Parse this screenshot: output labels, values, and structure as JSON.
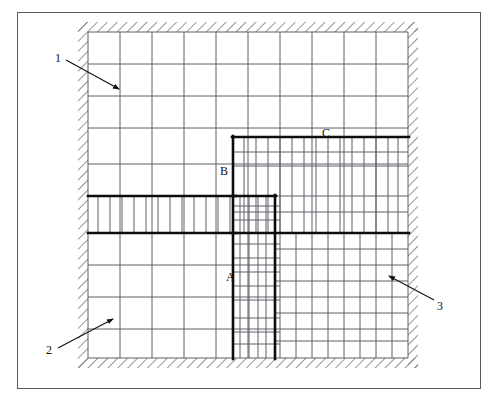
{
  "figure": {
    "kind": "finite-element-mesh-diagram",
    "caption": "",
    "frame_color": "#555b60",
    "mesh_line_color": "#5d6166",
    "bold_line_color": "#0d0d0d",
    "hatch_color": "#6f7479",
    "background": "#ffffff"
  },
  "node_labels": [
    {
      "id": "A",
      "text": "A",
      "x": 226,
      "y": 271
    },
    {
      "id": "B",
      "text": "B",
      "x": 220,
      "y": 165
    },
    {
      "id": "C",
      "text": "C",
      "x": 322,
      "y": 127
    }
  ],
  "callouts": [
    {
      "id": "1",
      "text": "1",
      "label_x": 55,
      "label_y": 52,
      "line": {
        "x1": 66,
        "y1": 60,
        "x2": 121,
        "y2": 90
      },
      "target": "interior-coarse-mesh-cell"
    },
    {
      "id": "2",
      "text": "2",
      "label_x": 46,
      "label_y": 344,
      "line": {
        "x1": 58,
        "y1": 348,
        "x2": 114,
        "y2": 318
      },
      "target": "lower-left-boundary-cell"
    },
    {
      "id": "3",
      "text": "3",
      "label_x": 437,
      "label_y": 306,
      "line": {
        "x1": 434,
        "y1": 300,
        "x2": 387,
        "y2": 275
      },
      "target": "right-boundary-cell"
    }
  ],
  "domain": {
    "mesh_left": 88,
    "mesh_right": 408,
    "mesh_top": 32,
    "mesh_bottom": 358,
    "wall_thickness": 10
  },
  "grid": {
    "coarse_x": [
      88,
      120,
      152,
      184,
      216,
      248,
      280,
      312,
      344,
      376,
      408
    ],
    "coarse_y": [
      32,
      64,
      96,
      128,
      164,
      196,
      233,
      265,
      297,
      329,
      358
    ]
  },
  "refined_regions": [
    {
      "name": "horizontal-band-left",
      "x0": 88,
      "y0": 196,
      "x1": 248,
      "y1": 233,
      "sub_x": [
        98,
        110,
        122,
        134,
        146,
        158,
        170,
        182,
        194,
        206,
        218,
        230
      ],
      "sub_y": []
    },
    {
      "name": "vertical-column-A",
      "x0": 233,
      "y0": 196,
      "x1": 275,
      "y1": 358,
      "sub_x": [
        240,
        249,
        258,
        266
      ],
      "sub_y": [
        206,
        220,
        244,
        258,
        272,
        286,
        300,
        318,
        332,
        344
      ]
    },
    {
      "name": "block-C-upper-right",
      "x0": 233,
      "y0": 137,
      "x1": 408,
      "y1": 233,
      "sub_x": [
        244,
        256,
        268,
        280,
        292,
        304,
        316,
        328,
        340,
        352,
        364,
        376,
        388,
        398
      ],
      "sub_y": [
        152,
        166,
        212
      ]
    },
    {
      "name": "lower-right-block",
      "x0": 275,
      "y0": 233,
      "x1": 408,
      "y1": 358,
      "sub_x": [
        292,
        324,
        356,
        388
      ],
      "sub_y": [
        249,
        281,
        313,
        341
      ]
    }
  ],
  "bold_paths": [
    {
      "name": "band-top-edge",
      "points": "88,196 233,196"
    },
    {
      "name": "band-bottom-edge",
      "points": "88,233 233,233"
    },
    {
      "name": "block-c-top",
      "points": "233,137 408,137"
    },
    {
      "name": "block-c-left",
      "points": "233,137 233,358"
    },
    {
      "name": "block-c-bottom",
      "points": "233,233 408,233"
    },
    {
      "name": "column-a-right",
      "points": "275,196 275,358"
    },
    {
      "name": "column-a-top",
      "points": "233,196 275,196"
    }
  ]
}
